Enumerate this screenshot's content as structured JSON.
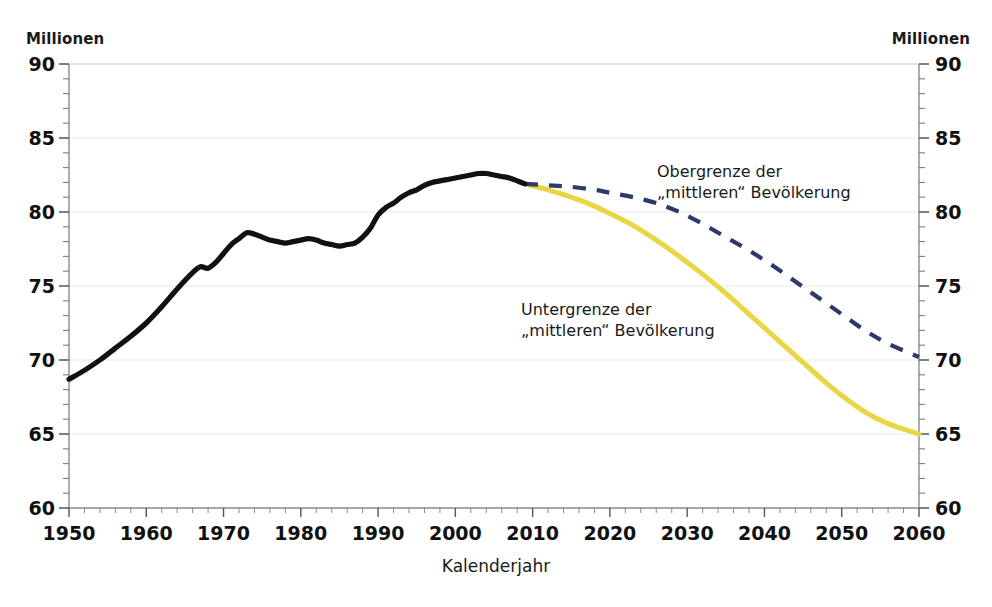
{
  "axis": {
    "unit_left": "Millionen",
    "unit_right": "Millionen",
    "xlabel": "Kalenderjahr",
    "ytick_labels": [
      "90",
      "85",
      "80",
      "75",
      "70",
      "65",
      "60"
    ],
    "ytick_values": [
      90,
      85,
      80,
      75,
      70,
      65,
      60
    ],
    "xtick_labels": [
      "1950",
      "1960",
      "1970",
      "1980",
      "1990",
      "2000",
      "2010",
      "2020",
      "2030",
      "2040",
      "2050",
      "2060"
    ],
    "xtick_values": [
      1950,
      1960,
      1970,
      1980,
      1990,
      2000,
      2010,
      2020,
      2030,
      2040,
      2050,
      2060
    ]
  },
  "annotations": {
    "upper_line1": "Obergrenze der",
    "upper_line2": "„mittleren“ Bevölkerung",
    "lower_line1": "Untergrenze der",
    "lower_line2": "„mittleren“ Bevölkerung"
  },
  "colors": {
    "historical": "#111111",
    "upper_bound": "#2b3a6b",
    "lower_bound": "#e8d645",
    "axis": "#8a8a8a",
    "grid": "#e2eaee",
    "text": "#1a1a1a"
  },
  "chart_data": {
    "type": "line",
    "title": "",
    "xlabel": "Kalenderjahr",
    "ylabel": "Millionen",
    "xlim": [
      1950,
      2060
    ],
    "ylim": [
      60,
      90
    ],
    "grid": true,
    "legend": "inline-annotations",
    "ytick_major_step": 5,
    "ytick_minor_step": 1,
    "xtick_major_step": 10,
    "xtick_minor_step": 2,
    "series": [
      {
        "name": "Historische Bevölkerung",
        "style": "solid",
        "color": "#111111",
        "x": [
          1950,
          1952,
          1954,
          1956,
          1958,
          1960,
          1962,
          1964,
          1966,
          1967,
          1968,
          1969,
          1970,
          1971,
          1972,
          1973,
          1974,
          1975,
          1976,
          1977,
          1978,
          1979,
          1980,
          1981,
          1982,
          1983,
          1984,
          1985,
          1986,
          1987,
          1988,
          1989,
          1990,
          1991,
          1992,
          1993,
          1994,
          1995,
          1996,
          1997,
          1998,
          1999,
          2000,
          2001,
          2002,
          2003,
          2004,
          2005,
          2006,
          2007,
          2008,
          2009
        ],
        "values": [
          68.7,
          69.3,
          70.0,
          70.8,
          71.6,
          72.5,
          73.6,
          74.8,
          75.9,
          76.3,
          76.2,
          76.6,
          77.2,
          77.8,
          78.2,
          78.6,
          78.5,
          78.3,
          78.1,
          78.0,
          77.9,
          78.0,
          78.1,
          78.2,
          78.1,
          77.9,
          77.8,
          77.7,
          77.8,
          77.9,
          78.3,
          78.9,
          79.8,
          80.3,
          80.6,
          81.0,
          81.3,
          81.5,
          81.8,
          82.0,
          82.1,
          82.2,
          82.3,
          82.4,
          82.5,
          82.6,
          82.6,
          82.5,
          82.4,
          82.3,
          82.1,
          81.9
        ]
      },
      {
        "name": "Obergrenze der „mittleren“ Bevölkerung",
        "style": "dashed",
        "color": "#2b3a6b",
        "x": [
          2009,
          2012,
          2015,
          2018,
          2020,
          2023,
          2026,
          2029,
          2032,
          2035,
          2038,
          2041,
          2044,
          2047,
          2050,
          2053,
          2056,
          2060
        ],
        "values": [
          81.9,
          81.8,
          81.7,
          81.5,
          81.3,
          81.0,
          80.6,
          80.0,
          79.2,
          78.3,
          77.4,
          76.4,
          75.3,
          74.2,
          73.1,
          72.0,
          71.1,
          70.2
        ]
      },
      {
        "name": "Untergrenze der „mittleren“ Bevölkerung",
        "style": "solid",
        "color": "#e8d645",
        "x": [
          2009,
          2012,
          2015,
          2018,
          2020,
          2023,
          2026,
          2029,
          2032,
          2035,
          2038,
          2041,
          2044,
          2047,
          2050,
          2053,
          2056,
          2060
        ],
        "values": [
          81.9,
          81.5,
          81.0,
          80.4,
          79.9,
          79.1,
          78.1,
          77.0,
          75.8,
          74.5,
          73.1,
          71.7,
          70.3,
          68.9,
          67.6,
          66.5,
          65.7,
          65.0
        ]
      }
    ]
  }
}
